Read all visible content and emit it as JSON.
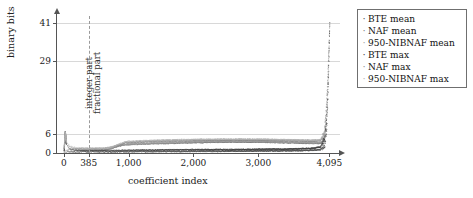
{
  "chart_data": {
    "type": "scatter",
    "title": "",
    "xlabel": "coefficient index",
    "ylabel": "binary bits",
    "xlim": [
      -120,
      4260
    ],
    "ylim": [
      0,
      44
    ],
    "grid": true,
    "legend_position": "right-outside",
    "xticks": [
      {
        "value": 0,
        "label": "0"
      },
      {
        "value": 385,
        "label": "385"
      },
      {
        "value": 1000,
        "label": "1,000"
      },
      {
        "value": 2000,
        "label": "2,000"
      },
      {
        "value": 3000,
        "label": "3,000"
      },
      {
        "value": 4095,
        "label": "4,095"
      }
    ],
    "yticks": [
      {
        "value": 0,
        "label": "0",
        "gridline": false
      },
      {
        "value": 6,
        "label": "6",
        "gridline": true
      },
      {
        "value": 29,
        "label": "29",
        "gridline": true
      },
      {
        "value": 41,
        "label": "41",
        "gridline": true
      }
    ],
    "annotations": [
      {
        "name": "integer-part",
        "text": "integer part",
        "x": 385,
        "side": "left"
      },
      {
        "name": "fractional-part",
        "text": "fractional part",
        "x": 385,
        "side": "right"
      }
    ],
    "separator_x": 385,
    "series": [
      {
        "name": "BTE mean",
        "color": "#4d4d4d",
        "marker": "dot",
        "points": [
          [
            0,
            0.4
          ],
          [
            10,
            0.4
          ],
          [
            20,
            0.4
          ],
          [
            30,
            0.4
          ],
          [
            60,
            0.45
          ],
          [
            120,
            0.45
          ],
          [
            200,
            0.5
          ],
          [
            385,
            0.5
          ],
          [
            600,
            0.5
          ],
          [
            800,
            0.5
          ],
          [
            1000,
            0.55
          ],
          [
            1200,
            0.6
          ],
          [
            1400,
            0.6
          ],
          [
            1600,
            0.65
          ],
          [
            1800,
            0.65
          ],
          [
            2000,
            0.7
          ],
          [
            2200,
            0.7
          ],
          [
            2400,
            0.7
          ],
          [
            2600,
            0.75
          ],
          [
            2800,
            0.75
          ],
          [
            3000,
            0.8
          ],
          [
            3200,
            0.8
          ],
          [
            3400,
            0.85
          ],
          [
            3600,
            0.9
          ],
          [
            3800,
            1.0
          ],
          [
            3950,
            1.2
          ],
          [
            4020,
            2.5
          ],
          [
            4050,
            8
          ],
          [
            4065,
            16
          ],
          [
            4075,
            23
          ],
          [
            4082,
            29
          ],
          [
            4088,
            34
          ],
          [
            4092,
            38
          ],
          [
            4094,
            40
          ],
          [
            4095,
            40.5
          ]
        ]
      },
      {
        "name": "NAF mean",
        "color": "#7a7a7a",
        "marker": "dot",
        "points": [
          [
            0,
            0.6
          ],
          [
            20,
            0.6
          ],
          [
            60,
            0.7
          ],
          [
            200,
            0.8
          ],
          [
            385,
            0.9
          ],
          [
            600,
            1.0
          ],
          [
            900,
            2.6
          ],
          [
            1000,
            2.8
          ],
          [
            1200,
            3.0
          ],
          [
            1400,
            3.1
          ],
          [
            1600,
            3.2
          ],
          [
            1800,
            3.3
          ],
          [
            2000,
            3.4
          ],
          [
            2200,
            3.5
          ],
          [
            2400,
            3.6
          ],
          [
            2600,
            3.6
          ],
          [
            2800,
            3.6
          ],
          [
            3000,
            3.6
          ],
          [
            3200,
            3.5
          ],
          [
            3400,
            3.4
          ],
          [
            3600,
            3.3
          ],
          [
            3800,
            3.2
          ],
          [
            3950,
            3.2
          ],
          [
            4010,
            4.0
          ],
          [
            4040,
            9
          ],
          [
            4060,
            17
          ],
          [
            4072,
            24
          ],
          [
            4082,
            30
          ],
          [
            4089,
            35
          ],
          [
            4093,
            39
          ],
          [
            4095,
            41
          ]
        ]
      },
      {
        "name": "950-NIBNAF mean",
        "color": "#9e9e9e",
        "marker": "dot",
        "points": [
          [
            0,
            0.8
          ],
          [
            20,
            1.0
          ],
          [
            60,
            1.2
          ],
          [
            200,
            1.4
          ],
          [
            385,
            1.5
          ],
          [
            600,
            1.6
          ],
          [
            900,
            2.9
          ],
          [
            1000,
            3.1
          ],
          [
            1200,
            3.3
          ],
          [
            1400,
            3.4
          ],
          [
            1600,
            3.5
          ],
          [
            1800,
            3.6
          ],
          [
            2000,
            3.7
          ],
          [
            2200,
            3.8
          ],
          [
            2400,
            3.9
          ],
          [
            2600,
            3.9
          ],
          [
            2800,
            3.9
          ],
          [
            3000,
            3.8
          ],
          [
            3200,
            3.7
          ],
          [
            3400,
            3.6
          ],
          [
            3600,
            3.5
          ],
          [
            3800,
            3.4
          ],
          [
            3950,
            3.4
          ],
          [
            4010,
            4.5
          ],
          [
            4040,
            10
          ],
          [
            4060,
            18
          ],
          [
            4072,
            25
          ],
          [
            4082,
            31
          ],
          [
            4089,
            36
          ],
          [
            4093,
            40
          ],
          [
            4095,
            41
          ]
        ]
      },
      {
        "name": "BTE max",
        "color": "#3a3a3a",
        "marker": "dot",
        "points": [
          [
            0,
            1.0
          ],
          [
            5,
            3.0
          ],
          [
            10,
            5.0
          ],
          [
            15,
            6.2
          ],
          [
            20,
            5.5
          ],
          [
            30,
            4.0
          ],
          [
            45,
            2.5
          ],
          [
            80,
            1.5
          ],
          [
            150,
            1.0
          ],
          [
            300,
            0.9
          ],
          [
            385,
            0.9
          ],
          [
            700,
            0.9
          ],
          [
            1000,
            1.0
          ],
          [
            1500,
            1.1
          ],
          [
            2000,
            1.2
          ],
          [
            2500,
            1.2
          ],
          [
            3000,
            1.3
          ],
          [
            3500,
            1.4
          ],
          [
            3800,
            1.6
          ],
          [
            3950,
            2.0
          ],
          [
            4020,
            5.0
          ],
          [
            4050,
            12
          ],
          [
            4065,
            20
          ],
          [
            4075,
            26
          ],
          [
            4082,
            32
          ],
          [
            4088,
            36
          ],
          [
            4092,
            39
          ],
          [
            4095,
            41
          ]
        ]
      },
      {
        "name": "NAF max",
        "color": "#8a8a8a",
        "marker": "dot",
        "points": [
          [
            0,
            1.5
          ],
          [
            8,
            4.0
          ],
          [
            14,
            6.0
          ],
          [
            22,
            5.0
          ],
          [
            40,
            3.0
          ],
          [
            90,
            1.8
          ],
          [
            200,
            1.4
          ],
          [
            385,
            1.3
          ],
          [
            700,
            1.3
          ],
          [
            950,
            3.4
          ],
          [
            1200,
            3.7
          ],
          [
            1500,
            3.9
          ],
          [
            2000,
            4.1
          ],
          [
            2500,
            4.2
          ],
          [
            3000,
            4.2
          ],
          [
            3500,
            4.0
          ],
          [
            3800,
            3.9
          ],
          [
            3950,
            4.0
          ],
          [
            4010,
            6.0
          ],
          [
            4040,
            13
          ],
          [
            4060,
            21
          ],
          [
            4072,
            28
          ],
          [
            4082,
            33
          ],
          [
            4089,
            37
          ],
          [
            4093,
            40
          ],
          [
            4095,
            41
          ]
        ]
      },
      {
        "name": "950-NIBNAF max",
        "color": "#b0b0b0",
        "marker": "dot",
        "points": [
          [
            0,
            2.0
          ],
          [
            8,
            5.0
          ],
          [
            14,
            6.5
          ],
          [
            22,
            5.5
          ],
          [
            40,
            3.5
          ],
          [
            90,
            2.2
          ],
          [
            200,
            1.8
          ],
          [
            385,
            1.7
          ],
          [
            700,
            1.7
          ],
          [
            950,
            3.8
          ],
          [
            1200,
            4.0
          ],
          [
            1500,
            4.2
          ],
          [
            2000,
            4.4
          ],
          [
            2500,
            4.5
          ],
          [
            3000,
            4.5
          ],
          [
            3500,
            4.3
          ],
          [
            3800,
            4.2
          ],
          [
            3950,
            4.3
          ],
          [
            4010,
            6.5
          ],
          [
            4040,
            14
          ],
          [
            4060,
            22
          ],
          [
            4072,
            29
          ],
          [
            4082,
            34
          ],
          [
            4089,
            38
          ],
          [
            4093,
            40.5
          ],
          [
            4095,
            41
          ]
        ]
      }
    ]
  },
  "legend": {
    "items": [
      {
        "label": "BTE mean",
        "color": "#4d4d4d"
      },
      {
        "label": "NAF mean",
        "color": "#7a7a7a"
      },
      {
        "label": "950-NIBNAF mean",
        "color": "#9e9e9e"
      },
      {
        "label": "BTE max",
        "color": "#3a3a3a"
      },
      {
        "label": "NAF max",
        "color": "#8a8a8a"
      },
      {
        "label": "950-NIBNAF max",
        "color": "#b0b0b0"
      }
    ]
  },
  "colors": {
    "axis": "#555555",
    "grid": "#d8d8d8",
    "text": "#222222",
    "separator": "#9a9a9a",
    "legend_border": "#6f6f6f",
    "background": "#ffffff"
  }
}
